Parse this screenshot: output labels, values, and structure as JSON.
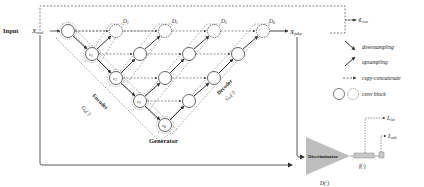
{
  "input": {
    "label": "Input",
    "symbol": "X",
    "sub": "real"
  },
  "output": {
    "symbol": "X",
    "sub": "fake"
  },
  "latent_nodes": [
    {
      "label": "z",
      "sub": "1"
    },
    {
      "label": "z",
      "sub": "2"
    },
    {
      "label": "z",
      "sub": "3"
    },
    {
      "label": "z",
      "sub": "4"
    }
  ],
  "deep_supervision": [
    {
      "label": "D",
      "sub": "1"
    },
    {
      "label": "D",
      "sub": "2"
    },
    {
      "label": "D",
      "sub": "3"
    },
    {
      "label": "D",
      "sub": "4"
    }
  ],
  "encoder": {
    "label": "Encoder",
    "fn": "G",
    "fn_sub": "E",
    "fn_arg": "(·)"
  },
  "decoder": {
    "label": "Decoder",
    "fn": "G",
    "fn_sub": "D",
    "fn_arg": "(·)"
  },
  "generator_label": "Generator",
  "discriminator": {
    "label": "Discriminator",
    "fn": "D(·)",
    "feature_fn": "f(·)"
  },
  "losses": {
    "con": {
      "symbol": "L",
      "sub": "con"
    },
    "lat": {
      "symbol": "L",
      "sub": "lat"
    },
    "adv": {
      "symbol": "L",
      "sub": "adv"
    }
  },
  "legend": [
    {
      "icon": "downsampling-arrow-icon",
      "label": "downsampling"
    },
    {
      "icon": "upsampling-arrow-icon",
      "label": "upsampling"
    },
    {
      "icon": "copy-concatenate-arrow-icon",
      "label": "copy-concatenate"
    },
    {
      "icon": "conv-block-icon",
      "label": "conv block"
    }
  ],
  "colors": {
    "line": "#444444",
    "dash": "#666666",
    "node_stroke": "#555555",
    "triangle": "#bdbdbd",
    "feature_bar": "#c8c8c8"
  }
}
